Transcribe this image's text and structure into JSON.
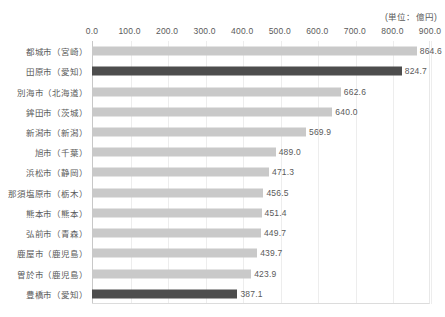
{
  "unit_note": "(単位：億円)",
  "chart_data": {
    "type": "bar",
    "orientation": "horizontal",
    "title": "",
    "subtitle": "",
    "xlabel": "",
    "ylabel": "",
    "unit_label": "(単位：億円)",
    "xlim": [
      0,
      900
    ],
    "xticks": [
      0,
      100,
      200,
      300,
      400,
      500,
      600,
      700,
      800,
      900
    ],
    "xtick_labels": [
      "0.0",
      "100.0",
      "200.0",
      "300.0",
      "400.0",
      "500.0",
      "600.0",
      "700.0",
      "800.0",
      "900.0"
    ],
    "grid": true,
    "grid_axis": "x",
    "legend": false,
    "bar_color": "#c9c9c9",
    "highlight_color": "#4d4d4d",
    "categories": [
      "都城市（宮崎）",
      "田原市（愛知）",
      "別海市（北海道）",
      "鉾田市（茨城）",
      "新潟市（新潟）",
      "旭市（千葉）",
      "浜松市（静岡）",
      "那須塩原市（栃木）",
      "熊本市（熊本）",
      "弘前市（青森）",
      "鹿屋市（鹿児島）",
      "曽於市（鹿児島）",
      "豊橋市（愛知）"
    ],
    "values": [
      864.6,
      824.7,
      662.6,
      640.0,
      569.9,
      489.0,
      471.3,
      456.5,
      451.4,
      449.7,
      439.7,
      423.9,
      387.1
    ],
    "value_labels": [
      "864.6",
      "824.7",
      "662.6",
      "640.0",
      "569.9",
      "489.0",
      "471.3",
      "456.5",
      "451.4",
      "449.7",
      "439.7",
      "423.9",
      "387.1"
    ],
    "highlighted": [
      false,
      true,
      false,
      false,
      false,
      false,
      false,
      false,
      false,
      false,
      false,
      false,
      true
    ]
  }
}
